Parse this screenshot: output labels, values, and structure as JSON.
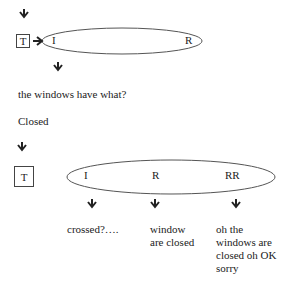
{
  "diagram": {
    "top": {
      "box_label": "T",
      "ellipse_labels": [
        "I",
        "R"
      ]
    },
    "question": "the windows have what?",
    "answer": "Closed",
    "bottom": {
      "box_label": "T",
      "ellipse_labels": [
        "I",
        "R",
        "RR"
      ],
      "responses": [
        {
          "lines": [
            "crossed?…."
          ]
        },
        {
          "lines": [
            "window",
            "are closed"
          ]
        },
        {
          "lines": [
            "oh the",
            "windows are",
            "closed oh OK",
            "sorry"
          ]
        }
      ]
    },
    "icons": [
      "arrow-down-icon",
      "arrow-right-icon"
    ]
  }
}
